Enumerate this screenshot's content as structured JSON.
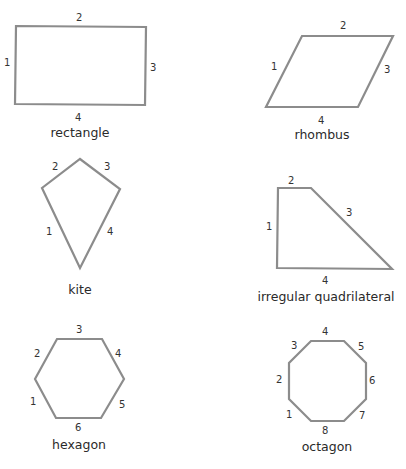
{
  "colors": {
    "stroke": "#8c8c8c",
    "text": "#2a2a2a"
  },
  "shapes": [
    {
      "name": "rectangle",
      "label": "rectangle",
      "sides": [
        "1",
        "2",
        "3",
        "4"
      ]
    },
    {
      "name": "rhombus",
      "label": "rhombus",
      "sides": [
        "1",
        "2",
        "3",
        "4"
      ]
    },
    {
      "name": "kite",
      "label": "kite",
      "sides": [
        "1",
        "2",
        "3",
        "4"
      ]
    },
    {
      "name": "irregular-quadrilateral",
      "label": "irregular quadrilateral",
      "sides": [
        "1",
        "2",
        "3",
        "4"
      ]
    },
    {
      "name": "hexagon",
      "label": "hexagon",
      "sides": [
        "1",
        "2",
        "3",
        "4",
        "5",
        "6"
      ]
    },
    {
      "name": "octagon",
      "label": "octagon",
      "sides": [
        "1",
        "2",
        "3",
        "4",
        "5",
        "6",
        "7",
        "8"
      ]
    }
  ]
}
